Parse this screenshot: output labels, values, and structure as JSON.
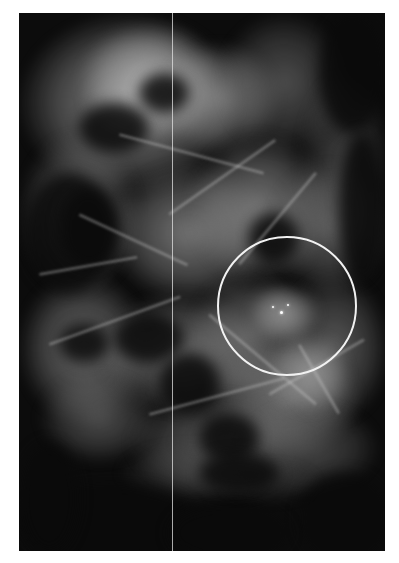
{
  "image": {
    "type": "mammogram",
    "description": "Grayscale breast X-ray with circled region of interest containing microcalcifications",
    "region": {
      "left": 19,
      "top": 13,
      "width": 366,
      "height": 538
    }
  },
  "annotations": {
    "roi_circle": {
      "center_x": 287,
      "center_y": 306,
      "radius": 70,
      "color": "#f2f2f2"
    },
    "vertical_line": {
      "x": 172,
      "color": "#e1e1e1"
    }
  },
  "colors": {
    "background": "#ffffff",
    "image_dark": "#0c0c0c",
    "tissue_light": "#bdbdbd"
  }
}
